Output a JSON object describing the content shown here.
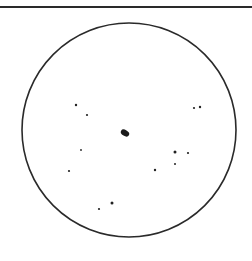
{
  "figure": {
    "frame_color": "#2a2a2a",
    "circle": {
      "cx": 129,
      "cy": 130,
      "r": 107
    },
    "central_blob": {
      "cx": 125,
      "cy": 133,
      "rx": 4.5,
      "ry": 3,
      "rotate": 30
    },
    "stars": [
      {
        "x": 76,
        "y": 105,
        "r": 1.2
      },
      {
        "x": 87,
        "y": 115,
        "r": 1.1
      },
      {
        "x": 194,
        "y": 108,
        "r": 1.1
      },
      {
        "x": 200,
        "y": 107,
        "r": 1.2
      },
      {
        "x": 81,
        "y": 150,
        "r": 0.9
      },
      {
        "x": 175,
        "y": 152,
        "r": 1.5
      },
      {
        "x": 188,
        "y": 153,
        "r": 1.1
      },
      {
        "x": 175,
        "y": 164,
        "r": 1.0
      },
      {
        "x": 69,
        "y": 171,
        "r": 1.1
      },
      {
        "x": 155,
        "y": 170,
        "r": 1.2
      },
      {
        "x": 112,
        "y": 203,
        "r": 1.5
      },
      {
        "x": 99,
        "y": 209,
        "r": 1.1
      }
    ]
  }
}
